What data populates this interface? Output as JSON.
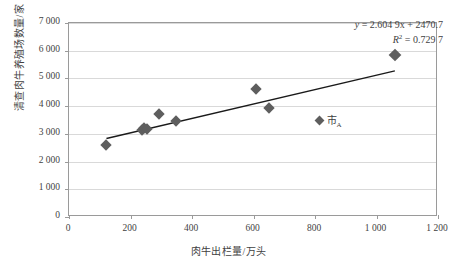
{
  "chart_data": {
    "type": "scatter",
    "title": "",
    "xlabel": "肉牛出栏量/万头",
    "ylabel": "清查肉牛养殖场数量/家",
    "xlim": [
      0,
      1200
    ],
    "ylim": [
      0,
      7000
    ],
    "xticks": [
      "0",
      "200",
      "400",
      "600",
      "800",
      "1 000",
      "1 200"
    ],
    "xtick_values": [
      0,
      200,
      400,
      600,
      800,
      1000,
      1200
    ],
    "yticks": [
      "0",
      "1 000",
      "2 000",
      "3 000",
      "4 000",
      "5 000",
      "6 000",
      "7 000"
    ],
    "ytick_values": [
      0,
      1000,
      2000,
      3000,
      4000,
      5000,
      6000,
      7000
    ],
    "grid": "horizontal",
    "series": [
      {
        "name": "市A",
        "marker": "diamond",
        "color": "#5e5e5e",
        "points": [
          {
            "x": 125,
            "y": 2560
          },
          {
            "x": 240,
            "y": 3120
          },
          {
            "x": 248,
            "y": 3170
          },
          {
            "x": 258,
            "y": 3150
          },
          {
            "x": 295,
            "y": 3670
          },
          {
            "x": 352,
            "y": 3420
          },
          {
            "x": 613,
            "y": 4580
          },
          {
            "x": 653,
            "y": 3910
          },
          {
            "x": 1063,
            "y": 5800
          }
        ]
      }
    ],
    "trendline": {
      "type": "linear",
      "slope": 2.6049,
      "intercept": 2470.7,
      "r_squared": 0.7297,
      "x_start": 125,
      "x_end": 1063,
      "color": "#1a1a1a"
    },
    "annotations": {
      "equation": "y = 2.604 9x + 2470.7",
      "equation_lhs": "y",
      "equation_rhs": "= 2.604 9x + 2470.7",
      "r2_symbol": "R",
      "r2_sup": "2",
      "r2_value": "= 0.729 7"
    },
    "legend": {
      "position": "inside-right",
      "entries": [
        {
          "label_main": "市",
          "label_sub": "A",
          "marker": "diamond",
          "color": "#5e5e5e"
        }
      ]
    },
    "colors": {
      "marker": "#5e5e5e",
      "trendline": "#1a1a1a",
      "gridline": "#d9d9d9",
      "axis": "#9a9a9a",
      "text": "#3f3f3f",
      "background": "#ffffff"
    }
  }
}
